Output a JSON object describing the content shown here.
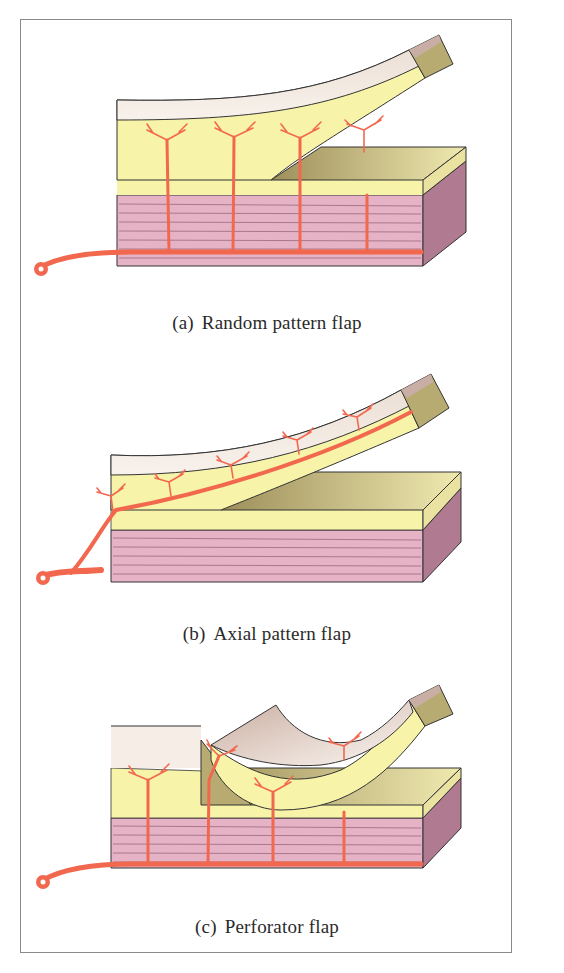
{
  "figure": {
    "panels": [
      {
        "id": "a",
        "tag": "(a)",
        "label": "Random pattern flap"
      },
      {
        "id": "b",
        "tag": "(b)",
        "label": "Axial pattern flap"
      },
      {
        "id": "c",
        "tag": "(c)",
        "label": "Perforator flap"
      }
    ],
    "colors": {
      "epidermis": "#efe3da",
      "dermis_cut": "#b8ab72",
      "subcutaneous_fat": "#f7f3a8",
      "muscle": "#e6b3c6",
      "muscle_side": "#b07a90",
      "vessel": "#f2684f",
      "outline": "#333333",
      "frame_border": "#8a8a8a"
    }
  }
}
